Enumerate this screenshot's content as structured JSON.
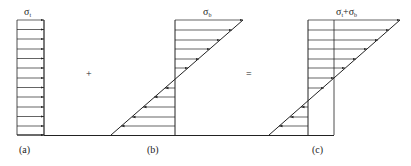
{
  "figure": {
    "panels": [
      {
        "id": "a",
        "caption": "(a)",
        "label": {
          "symbol": "σ",
          "subscript": "t"
        },
        "type": "uniform-stress-block",
        "description": "Uniform tensile stress distribution, arrows pointing right"
      },
      {
        "id": "b",
        "caption": "(b)",
        "label": {
          "symbol": "σ",
          "subscript": "b"
        },
        "type": "linear-bending-stress",
        "description": "Linear bending stress; arrows right above neutral axis, left below"
      },
      {
        "id": "c",
        "caption": "(c)",
        "label": {
          "symbol1": "σ",
          "subscript1": "t",
          "plus": "+",
          "symbol2": "σ",
          "subscript2": "b"
        },
        "type": "combined-stress",
        "description": "Superposition of uniform and bending stress"
      }
    ],
    "operators": {
      "plus": "+",
      "equals": "="
    }
  },
  "colors": {
    "line": "#222222",
    "background": "#ffffff"
  }
}
